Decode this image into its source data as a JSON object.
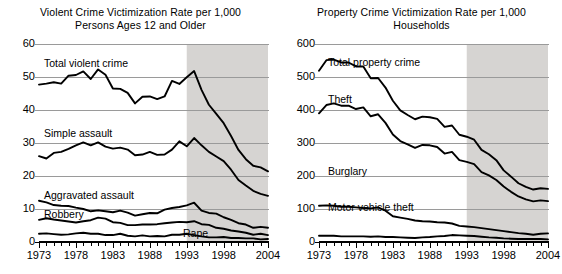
{
  "figure": {
    "background": "#ffffff",
    "line_color": "#000000",
    "grid_color": "#9a9a9a",
    "shade_color": "#d6d4d2",
    "shade_label": "shaded-period-1993-2004"
  },
  "charts": [
    {
      "id": "violent-crime",
      "title_line1": "Violent Crime Victimization Rate per 1,000",
      "title_line2": "Persons Ages 12 and Older",
      "chart_data": {
        "type": "line",
        "title": "Violent Crime Victimization Rate per 1,000 Persons Ages 12 and Older",
        "xlabel": "",
        "ylabel": "",
        "xlim": [
          1973,
          2004
        ],
        "ylim": [
          0,
          60
        ],
        "yticks": [
          0,
          10,
          20,
          30,
          40,
          50,
          60
        ],
        "xticks": [
          1973,
          1978,
          1983,
          1988,
          1993,
          1998,
          2004
        ],
        "xtick_minor_step": 1,
        "grid": "horizontal",
        "legend": "inline-labels",
        "shaded_region": [
          1993,
          2004
        ],
        "x": [
          1973,
          1974,
          1975,
          1976,
          1977,
          1978,
          1979,
          1980,
          1981,
          1982,
          1983,
          1984,
          1985,
          1986,
          1987,
          1988,
          1989,
          1990,
          1991,
          1992,
          1993,
          1994,
          1995,
          1996,
          1997,
          1998,
          1999,
          2000,
          2001,
          2002,
          2003,
          2004
        ],
        "series": [
          {
            "name": "Total violent crime",
            "values": [
              47.7,
              48.0,
              48.4,
              48.0,
              50.4,
              50.6,
              51.7,
              49.4,
              52.3,
              50.7,
              46.5,
              46.4,
              45.2,
              42.0,
              44.0,
              44.1,
              43.3,
              44.1,
              48.8,
              47.9,
              49.9,
              51.8,
              46.1,
              41.6,
              38.8,
              36.0,
              32.1,
              27.9,
              25.1,
              23.1,
              22.6,
              21.4
            ]
          },
          {
            "name": "Simple assault",
            "values": [
              26.0,
              25.3,
              27.0,
              27.3,
              28.2,
              29.3,
              30.2,
              29.3,
              30.2,
              28.9,
              28.3,
              28.6,
              28.0,
              26.3,
              26.5,
              27.3,
              26.4,
              26.5,
              28.0,
              30.5,
              29.0,
              31.5,
              29.3,
              27.3,
              25.9,
              24.5,
              21.9,
              18.8,
              17.1,
              15.5,
              14.6,
              14.0
            ]
          },
          {
            "name": "Aggravated assault",
            "values": [
              12.5,
              12.0,
              11.2,
              11.0,
              10.9,
              10.4,
              10.0,
              9.3,
              9.6,
              9.3,
              9.0,
              9.5,
              8.9,
              8.0,
              8.4,
              8.8,
              8.7,
              9.8,
              10.3,
              10.6,
              11.1,
              11.9,
              9.5,
              8.8,
              8.6,
              7.5,
              6.7,
              5.7,
              5.3,
              4.3,
              4.6,
              4.3
            ]
          },
          {
            "name": "Robbery",
            "values": [
              6.7,
              7.2,
              6.8,
              6.5,
              6.2,
              5.9,
              6.3,
              6.6,
              7.4,
              7.1,
              6.0,
              5.8,
              5.1,
              5.1,
              5.3,
              5.3,
              5.4,
              5.7,
              5.9,
              6.1,
              6.0,
              6.3,
              5.4,
              5.2,
              4.3,
              4.0,
              3.5,
              3.2,
              2.8,
              2.2,
              2.5,
              2.1
            ]
          },
          {
            "name": "Rape",
            "values": [
              2.5,
              2.6,
              2.4,
              2.2,
              2.3,
              2.6,
              2.8,
              2.5,
              2.5,
              2.1,
              2.1,
              2.5,
              1.9,
              1.7,
              2.0,
              1.7,
              1.8,
              1.7,
              2.2,
              2.2,
              2.5,
              2.1,
              1.7,
              1.4,
              1.4,
              1.5,
              1.2,
              1.2,
              1.1,
              1.1,
              0.8,
              0.9
            ]
          }
        ]
      }
    },
    {
      "id": "property-crime",
      "title_line1": "Property Crime Victimization Rate per 1,000",
      "title_line2": "Households",
      "chart_data": {
        "type": "line",
        "title": "Property Crime Victimization Rate per 1,000 Households",
        "xlabel": "",
        "ylabel": "",
        "xlim": [
          1973,
          2004
        ],
        "ylim": [
          0,
          600
        ],
        "yticks": [
          0,
          100,
          200,
          300,
          400,
          500,
          600
        ],
        "xticks": [
          1973,
          1978,
          1983,
          1988,
          1993,
          1998,
          2004
        ],
        "xtick_minor_step": 1,
        "grid": "horizontal",
        "legend": "inline-labels",
        "shaded_region": [
          1993,
          2004
        ],
        "x": [
          1973,
          1974,
          1975,
          1976,
          1977,
          1978,
          1979,
          1980,
          1981,
          1982,
          1983,
          1984,
          1985,
          1986,
          1987,
          1988,
          1989,
          1990,
          1991,
          1992,
          1993,
          1994,
          1995,
          1996,
          1997,
          1998,
          1999,
          2000,
          2001,
          2002,
          2003,
          2004
        ],
        "series": [
          {
            "name": "Total property crime",
            "values": [
              519,
              551,
              553,
              544,
              544,
              532,
              532,
              496,
              497,
              468,
              428,
              399,
              385,
              372,
              380,
              378,
              373,
              349,
              353,
              325,
              319,
              310,
              279,
              266,
              248,
              217,
              198,
              178,
              167,
              159,
              163,
              161
            ]
          },
          {
            "name": "Theft",
            "values": [
              390,
              415,
              420,
              413,
              413,
              403,
              408,
              381,
              387,
              361,
              326,
              306,
              296,
              285,
              294,
              293,
              288,
              268,
              273,
              248,
              243,
              236,
              212,
              202,
              188,
              168,
              152,
              138,
              129,
              123,
              126,
              124
            ]
          },
          {
            "name": "Burglary",
            "values": [
              110,
              111,
              110,
              107,
              107,
              105,
              103,
              102,
              105,
              95,
              78,
              74,
              70,
              65,
              63,
              62,
              60,
              59,
              56,
              49,
              47,
              45,
              42,
              39,
              36,
              33,
              30,
              27,
              25,
              22,
              25,
              26
            ]
          },
          {
            "name": "Motor vehicle theft",
            "values": [
              19,
              19,
              19,
              17,
              17,
              17,
              17,
              16,
              17,
              15,
              15,
              14,
              13,
              12,
              14,
              15,
              17,
              18,
              21,
              20,
              19,
              18,
              16,
              14,
              13,
              11,
              10,
              9,
              9,
              9,
              9,
              8
            ]
          }
        ]
      }
    }
  ]
}
